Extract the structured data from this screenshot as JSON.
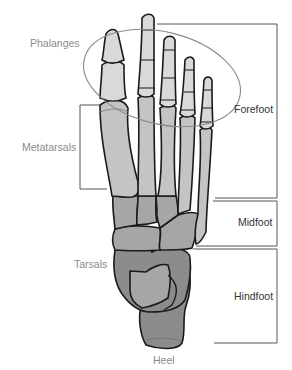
{
  "diagram": {
    "left_labels": {
      "phalanges": "Phalanges",
      "metatarsals": "Metatarsals",
      "tarsals": "Tarsals",
      "heel": "Heel"
    },
    "right_regions": {
      "forefoot": "Forefoot",
      "midfoot": "Midfoot",
      "hindfoot": "Hindfoot"
    },
    "colors": {
      "phalanx_fill": "#d9d9d9",
      "metatarsal_fill": "#c4c4c4",
      "tarsal_light": "#a6a6a6",
      "tarsal_dark": "#8c8c8c",
      "outline": "#1a1a1a",
      "ellipse": "#8a8a8a",
      "label_gray": "#8a8a8a",
      "bracket": "#555555"
    }
  }
}
